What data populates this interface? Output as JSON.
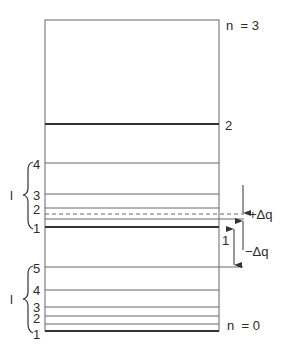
{
  "diagram": {
    "type": "energy-level-diagram",
    "box": {
      "x": 45,
      "y": 20,
      "width": 174,
      "height": 311
    },
    "colors": {
      "line": "#555555",
      "thick": "#333333",
      "text": "#2a2a2a",
      "background": "#ffffff"
    },
    "top_label": "n  = 3",
    "bottom_label": "n  = 0",
    "level_n2_label": "2",
    "upper_group": {
      "brace_label": "l",
      "levels": [
        {
          "label": "4",
          "y": 163
        },
        {
          "label": "3",
          "y": 194
        },
        {
          "label": "2",
          "y": 208
        },
        {
          "label": "1",
          "y": 227
        }
      ]
    },
    "lower_group": {
      "brace_label": "l",
      "levels": [
        {
          "label": "5",
          "y": 267
        },
        {
          "label": "4",
          "y": 290
        },
        {
          "label": "3",
          "y": 307
        },
        {
          "label": "2",
          "y": 316
        },
        {
          "label": "1",
          "y": 331
        }
      ]
    },
    "annotations": {
      "plus_dq": "+Δq",
      "minus_dq": "−Δq",
      "unit_spacing": "1"
    }
  }
}
